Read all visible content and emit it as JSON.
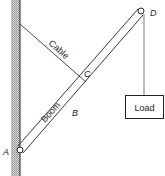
{
  "diagram": {
    "type": "boom-and-cable structure",
    "labels": {
      "cable": "Cable",
      "boom": "Boom",
      "load": "Load",
      "point_a": "A",
      "point_b": "B",
      "point_c": "C",
      "point_d": "D"
    },
    "colors": {
      "line": "#222222",
      "wall_hatch": "#9a9a9a",
      "background": "#ffffff"
    }
  }
}
